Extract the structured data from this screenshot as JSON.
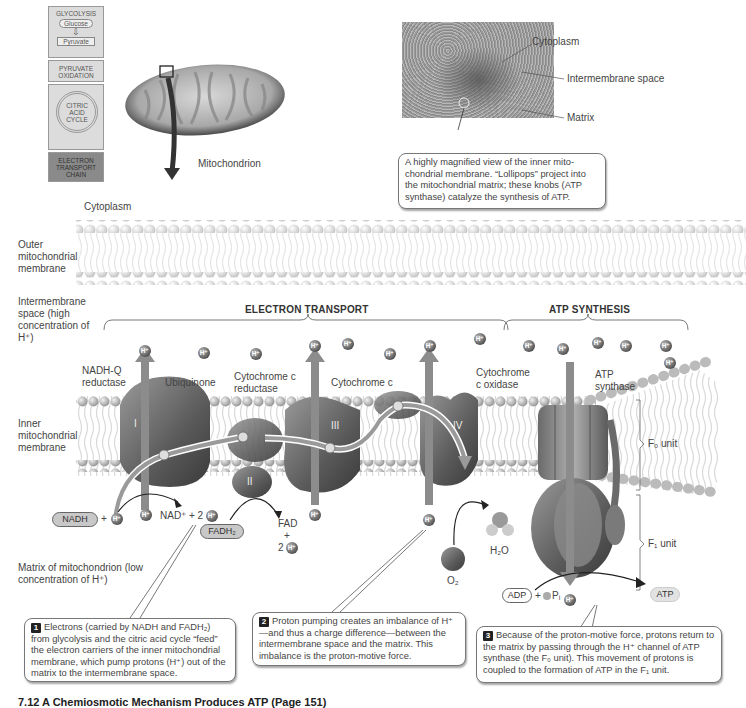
{
  "pathway": {
    "glycolysis": "GLYCOLYSIS",
    "glucose": "Glucose",
    "pyruvate": "Pyruvate",
    "pyruvate_oxidation": "PYRUVATE OXIDATION",
    "citric_acid_cycle": "CITRIC ACID CYCLE",
    "etc": "ELECTRON TRANSPORT CHAIN"
  },
  "mitochondrion_label": "Mitochondrion",
  "micrograph": {
    "cytoplasm": "Cytoplasm",
    "intermembrane_space": "Intermembrane space",
    "matrix": "Matrix",
    "caption": "A highly magnified view of the inner mito-chondrial membrane. “Lollipops” project into the mitochondrial matrix; these knobs (ATP synthase) catalyze the synthesis of ATP."
  },
  "regions": {
    "cytoplasm": "Cytoplasm",
    "outer_membrane": "Outer mitochondrial membrane",
    "intermembrane": "Intermembrane space (high concentration of H⁺)",
    "inner_membrane": "Inner mitochondrial membrane",
    "matrix": "Matrix of mitochondrion (low concentration of H⁺)"
  },
  "sections": {
    "electron_transport": "ELECTRON TRANSPORT",
    "atp_synthesis": "ATP SYNTHESIS"
  },
  "complexes": {
    "nadh_q": "NADH-Q reductase",
    "ubiquinone": "Ubiquinone",
    "cyt_c_reductase": "Cytochrome c reductase",
    "cyt_c": "Cytochrome c",
    "cyt_c_oxidase": "Cytochrome c oxidase",
    "atp_synthase": "ATP synthase",
    "roman": [
      "I",
      "II",
      "III",
      "IV"
    ],
    "f0_unit": "F₀ unit",
    "f1_unit": "F₁ unit"
  },
  "molecules": {
    "h_ion": "H⁺",
    "electron": "e⁻",
    "nadh": "NADH",
    "plus": "+",
    "nad_plus": "NAD⁺ + 2",
    "fadh2": "FADH₂",
    "fad": "FAD",
    "two": "2",
    "o2": "O₂",
    "h2o": "H₂O",
    "adp": "ADP",
    "pi": "Pᵢ",
    "atp": "ATP"
  },
  "callouts": [
    {
      "num": "1",
      "text": "Electrons (carried by NADH and FADH₂) from glycolysis and the citric acid cycle “feed” the electron carriers of the inner mitochondrial membrane, which pump protons (H⁺) out of the matrix to the intermembrane space."
    },
    {
      "num": "2",
      "text": "Proton pumping creates an imbalance of H⁺—and thus a charge difference—between the intermembrane space and the matrix. This imbalance is the proton-motive force."
    },
    {
      "num": "3",
      "text": "Because of the proton-motive force, protons return to the matrix by passing through the H⁺ channel of ATP synthase (the F₀ unit). This movement of protons is coupled to the formation of ATP in the F₁ unit."
    }
  ],
  "figure_caption": "7.12 A Chemiosmotic Mechanism Produces ATP (Page 151)",
  "colors": {
    "membrane_head": "#d8d8d8",
    "protein": "#6e6e6e",
    "arrow": "#8c8c8c",
    "electron_path": "#9a9a9a"
  }
}
